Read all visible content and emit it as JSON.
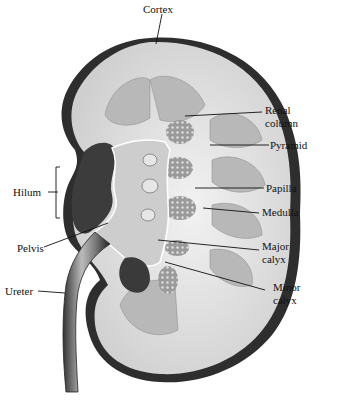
{
  "diagram": {
    "labels": {
      "cortex": "Cortex",
      "renal_column_1": "Renal",
      "renal_column_2": "column",
      "pyramid": "Pyramid",
      "papilla": "Papilla",
      "medulla": "Medulla",
      "major_calyx_1": "Major",
      "major_calyx_2": "calyx",
      "minor_calyx_1": "Minor",
      "minor_calyx_2": "calyx",
      "hilum": "Hilum",
      "pelvis": "Pelvis",
      "ureter": "Ureter"
    },
    "colors": {
      "ink": "#111111",
      "capsule": "#3a3a3a",
      "cortex": "#d8d8d8",
      "pyramid": "#bdbdbd",
      "sinus": "#4a4a4a",
      "pelvis": "#cfcfcf"
    }
  }
}
